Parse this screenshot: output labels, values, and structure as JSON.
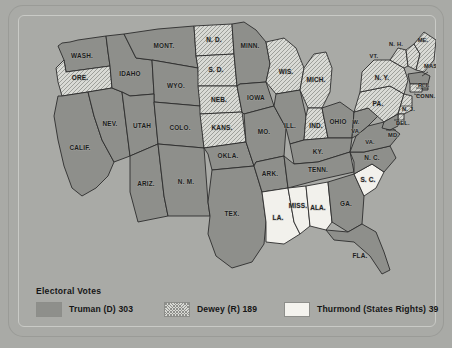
{
  "legend": {
    "title": "Electoral Votes",
    "items": [
      {
        "key": "truman",
        "label": "Truman (D) 303",
        "swatch": "solid-gray",
        "color": "#8e8f8b"
      },
      {
        "key": "dewey",
        "label": "Dewey (R) 189",
        "swatch": "hatched",
        "color": "#d9dad5"
      },
      {
        "key": "thurmond",
        "label": "Thurmond (States Rights) 39",
        "swatch": "white",
        "color": "#f4f3ee"
      }
    ]
  },
  "map": {
    "background_color": "#a9aaa6",
    "border_color": "#c9cac6",
    "state_outline_color": "#2c2c2c",
    "states": [
      {
        "abbr": "WASH.",
        "party": "truman"
      },
      {
        "abbr": "ORE.",
        "party": "dewey"
      },
      {
        "abbr": "IDAHO",
        "party": "truman"
      },
      {
        "abbr": "MONT.",
        "party": "truman"
      },
      {
        "abbr": "WYO.",
        "party": "truman"
      },
      {
        "abbr": "NEV.",
        "party": "truman"
      },
      {
        "abbr": "UTAH",
        "party": "truman"
      },
      {
        "abbr": "COLO.",
        "party": "truman"
      },
      {
        "abbr": "CALIF.",
        "party": "truman"
      },
      {
        "abbr": "ARIZ.",
        "party": "truman"
      },
      {
        "abbr": "N. M.",
        "party": "truman"
      },
      {
        "abbr": "N. D.",
        "party": "dewey"
      },
      {
        "abbr": "S. D.",
        "party": "dewey"
      },
      {
        "abbr": "NEB.",
        "party": "dewey"
      },
      {
        "abbr": "KANS.",
        "party": "dewey"
      },
      {
        "abbr": "OKLA.",
        "party": "truman"
      },
      {
        "abbr": "TEX.",
        "party": "truman"
      },
      {
        "abbr": "MINN.",
        "party": "truman"
      },
      {
        "abbr": "IOWA",
        "party": "truman"
      },
      {
        "abbr": "MO.",
        "party": "truman"
      },
      {
        "abbr": "ARK.",
        "party": "truman"
      },
      {
        "abbr": "LA.",
        "party": "thurmond"
      },
      {
        "abbr": "WIS.",
        "party": "dewey"
      },
      {
        "abbr": "ILL.",
        "party": "truman"
      },
      {
        "abbr": "MICH.",
        "party": "dewey"
      },
      {
        "abbr": "IND.",
        "party": "dewey"
      },
      {
        "abbr": "OHIO",
        "party": "truman"
      },
      {
        "abbr": "KY.",
        "party": "truman"
      },
      {
        "abbr": "TENN.",
        "party": "truman"
      },
      {
        "abbr": "MISS.",
        "party": "thurmond"
      },
      {
        "abbr": "ALA.",
        "party": "thurmond"
      },
      {
        "abbr": "GA.",
        "party": "truman"
      },
      {
        "abbr": "FLA.",
        "party": "truman"
      },
      {
        "abbr": "S. C.",
        "party": "thurmond"
      },
      {
        "abbr": "N. C.",
        "party": "truman"
      },
      {
        "abbr": "VA.",
        "party": "truman"
      },
      {
        "abbr": "W. VA.",
        "party": "truman"
      },
      {
        "abbr": "PA.",
        "party": "dewey"
      },
      {
        "abbr": "N. Y.",
        "party": "dewey"
      },
      {
        "abbr": "VT.",
        "party": "dewey"
      },
      {
        "abbr": "N. H.",
        "party": "dewey"
      },
      {
        "abbr": "ME.",
        "party": "dewey"
      },
      {
        "abbr": "MASS.",
        "party": "truman"
      },
      {
        "abbr": "R. I.",
        "party": "truman"
      },
      {
        "abbr": "CONN.",
        "party": "dewey"
      },
      {
        "abbr": "N. J.",
        "party": "dewey"
      },
      {
        "abbr": "DEL.",
        "party": "dewey"
      },
      {
        "abbr": "MD.",
        "party": "truman"
      }
    ],
    "labels": {
      "wash": "WASH.",
      "ore": "ORE.",
      "idaho": "IDAHO",
      "mont": "MONT.",
      "wyo": "WYO.",
      "nev": "NEV.",
      "utah": "UTAH",
      "colo": "COLO.",
      "calif": "CALIF.",
      "ariz": "ARIZ.",
      "nm": "N. M.",
      "nd": "N. D.",
      "sd": "S. D.",
      "neb": "NEB.",
      "kans": "KANS.",
      "okla": "OKLA.",
      "tex": "TEX.",
      "minn": "MINN.",
      "iowa": "IOWA",
      "mo": "MO.",
      "ark": "ARK.",
      "la": "LA.",
      "wis": "WIS.",
      "ill": "ILL.",
      "mich": "MICH.",
      "ind": "IND.",
      "ohio": "OHIO",
      "ky": "KY.",
      "tenn": "TENN.",
      "miss": "MISS.",
      "ala": "ALA.",
      "ga": "GA.",
      "fla": "FLA.",
      "sc": "S. C.",
      "nc": "N. C.",
      "va": "VA.",
      "wva1": "W.",
      "wva2": "VA.",
      "pa": "PA.",
      "ny": "N. Y.",
      "vt": "VT.",
      "nh": "N. H.",
      "me": "ME.",
      "mass": "MASS.",
      "ri": "R. I.",
      "conn": "CONN.",
      "nj": "N. J.",
      "del": "DEL.",
      "md": "MD."
    }
  }
}
